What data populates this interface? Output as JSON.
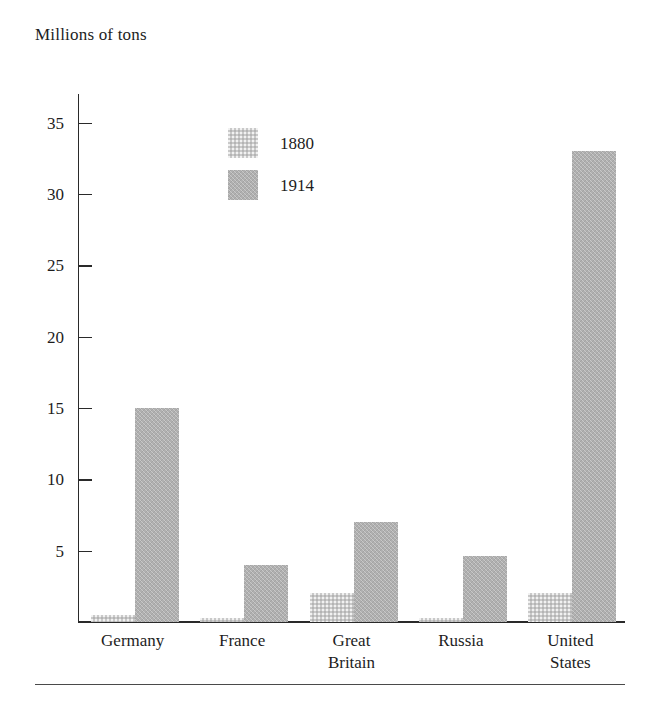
{
  "chart_data": {
    "type": "bar",
    "title": "Millions of tons",
    "ylabel": "Millions of tons",
    "xlabel": "",
    "categories": [
      "Germany",
      "France",
      "Great Britain",
      "Russia",
      "United States"
    ],
    "category_lines": [
      [
        "Germany"
      ],
      [
        "France"
      ],
      [
        "Great",
        "Britain"
      ],
      [
        "Russia"
      ],
      [
        "United",
        "States"
      ]
    ],
    "series": [
      {
        "name": "1880",
        "color": "#c9c9c9",
        "values": [
          0.5,
          0.3,
          2.0,
          0.3,
          2.0
        ]
      },
      {
        "name": "1914",
        "color": "#b0b0b0",
        "values": [
          15.0,
          4.0,
          7.0,
          4.6,
          33.0
        ]
      }
    ],
    "yticks": [
      5,
      10,
      15,
      20,
      25,
      30,
      35
    ],
    "ylim": [
      0,
      37
    ],
    "grid": false,
    "legend_position": "upper-center",
    "legend_entries": [
      "1880",
      "1914"
    ]
  },
  "axis": {
    "title": "Millions of tons",
    "tick_labels": [
      "35",
      "30",
      "25",
      "20",
      "15",
      "10",
      "5"
    ]
  },
  "legend": {
    "entries": [
      {
        "label": "1880",
        "swatch": "legend-swatch-1880"
      },
      {
        "label": "1914",
        "swatch": "legend-swatch-1914"
      }
    ]
  }
}
